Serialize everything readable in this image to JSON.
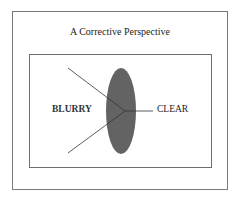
{
  "diagram": {
    "title": "A Corrective Perspective",
    "labels": {
      "left": "BLURRY",
      "right": "CLEAR"
    },
    "shapes": {
      "lens": {
        "type": "ellipse",
        "fill": "#636363"
      },
      "frames": {
        "outer_border": "#7a7a7a",
        "inner_border": "#6e6e6e"
      },
      "rays": {
        "color": "#333333",
        "count_incoming": 2,
        "count_outgoing": 1
      }
    }
  }
}
